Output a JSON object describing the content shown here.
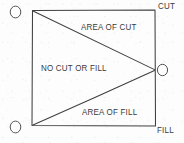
{
  "figure": {
    "background_color": "#fdfdfd",
    "ink_color": "#3a3a3a",
    "rectangle": {
      "x": 32,
      "y": 10,
      "width": 123,
      "height": 116
    },
    "apex": {
      "x": 155,
      "y": 70
    }
  },
  "region_labels": {
    "cut_area": "AREA OF CUT",
    "neutral_area": "NO CUT OR FILL",
    "fill_area": "AREA OF FILL"
  },
  "corner_labels": {
    "top_right": "CUT",
    "bottom_right": "FILL"
  },
  "node_markers": [
    {
      "name": "top-left-node",
      "glyph": "O",
      "x": 10,
      "y": 5
    },
    {
      "name": "right-middle-node",
      "glyph": "O",
      "x": 158,
      "y": 63
    },
    {
      "name": "bottom-left-node",
      "glyph": "O",
      "x": 10,
      "y": 120
    }
  ]
}
